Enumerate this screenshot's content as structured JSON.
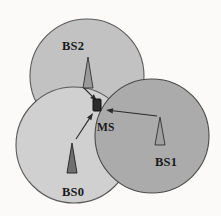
{
  "figure": {
    "kind": "cellular-handover-diagram",
    "width": 221,
    "height": 216,
    "background_color": "#fbfaf8"
  },
  "cells": [
    {
      "id": "bs2",
      "label": "BS2",
      "fill_color": "#c2c2c2",
      "stroke_color": "#5a5a5a",
      "cx": 87,
      "cy": 76,
      "r": 57,
      "label_x": 62,
      "label_y": 50,
      "antenna": {
        "name": "antenna-bs2",
        "apex_x": 88,
        "apex_y": 57,
        "base_y": 88,
        "half_width": 5,
        "fill_color": "#9a9a9a",
        "stroke_color": "#3d3d3d"
      },
      "arrow": {
        "name": "arrow-bs2-to-ms",
        "x1": 84,
        "y1": 88,
        "x2": 97,
        "y2": 101,
        "color": "#2a2a2a"
      }
    },
    {
      "id": "bs0",
      "label": "BS0",
      "fill_color": "#d0d0d0",
      "stroke_color": "#5a5a5a",
      "cx": 74,
      "cy": 145,
      "r": 58,
      "label_x": 62,
      "label_y": 196,
      "antenna": {
        "name": "antenna-bs0",
        "apex_x": 72,
        "apex_y": 143,
        "base_y": 173,
        "half_width": 5,
        "fill_color": "#6f6f6f",
        "stroke_color": "#2b2b2b"
      },
      "arrow": {
        "name": "arrow-bs0-to-ms",
        "x1": 76,
        "y1": 139,
        "x2": 93,
        "y2": 113,
        "color": "#2a2a2a"
      }
    },
    {
      "id": "bs1",
      "label": "BS1",
      "fill_color": "#ababab",
      "stroke_color": "#4a4a4a",
      "cx": 152,
      "cy": 136,
      "r": 57,
      "label_x": 155,
      "label_y": 166,
      "antenna": {
        "name": "antenna-bs1",
        "apex_x": 160,
        "apex_y": 117,
        "base_y": 145,
        "half_width": 5,
        "fill_color": "#a0a0a0",
        "stroke_color": "#3d3d3d"
      },
      "arrow": {
        "name": "arrow-bs1-to-ms",
        "x1": 157,
        "y1": 116,
        "x2": 106,
        "y2": 110,
        "color": "#2a2a2a"
      }
    }
  ],
  "mobile_station": {
    "name": "mobile-station-marker",
    "label": "MS",
    "x": 93,
    "y": 99,
    "width": 8,
    "height": 12,
    "fill_color": "#2b2b2b",
    "stroke_color": "#111111",
    "label_x": 97,
    "label_y": 131
  }
}
